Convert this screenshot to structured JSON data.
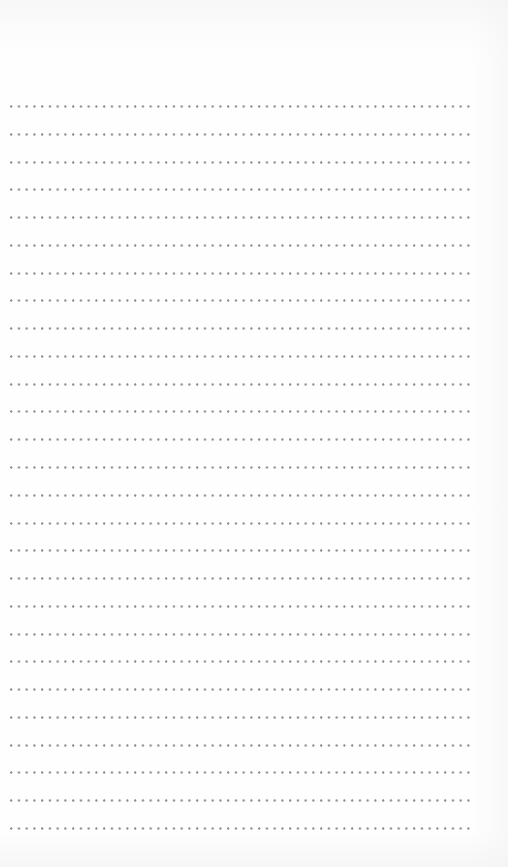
{
  "page": {
    "type": "ruled-notebook-page",
    "background_color": "#fdfdfd",
    "dot_color": "#8e8e8e",
    "line_style": "dotted",
    "line_count": 27,
    "first_line_y": 106,
    "line_spacing_px": 27.77,
    "line_left_x": 10,
    "line_right_x": 474,
    "dot_spacing_px": 7.75,
    "text_content": ""
  }
}
